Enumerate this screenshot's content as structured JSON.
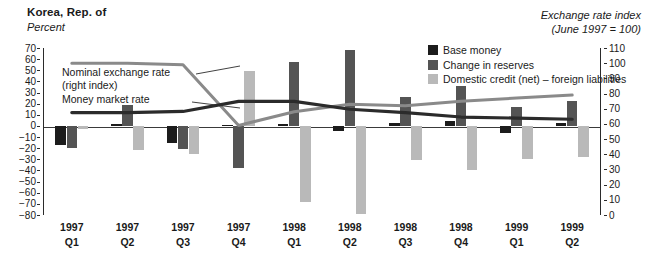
{
  "header": {
    "title": "Korea, Rep. of",
    "left_axis_unit": "Percent",
    "right_axis_unit_line1": "Exchange rate index",
    "right_axis_unit_line2": "(June 1997 = 100)"
  },
  "legend": {
    "items": [
      {
        "label": "Base money",
        "color": "#1c1c1c"
      },
      {
        "label": "Change in reserves",
        "color": "#545454"
      },
      {
        "label": "Domestic credit (net) – foreign liabilities",
        "color": "#b9b9b9"
      }
    ]
  },
  "annotations": [
    {
      "name": "nominal-exchange-rate",
      "line1": "Nominal exchange rate",
      "line2": "(right index)"
    },
    {
      "name": "money-market-rate",
      "line1": "Money market rate",
      "line2": ""
    }
  ],
  "chart_data": {
    "type": "bar",
    "title": "Korea, Rep. of",
    "subtitle": "",
    "xlabel": "",
    "ylabel": "Percent",
    "y2label": "Exchange rate index (June 1997 = 100)",
    "ylim": [
      -80,
      70
    ],
    "y2lim": [
      0,
      110
    ],
    "grid": false,
    "legend_position": "top-right",
    "categories": [
      "1997 Q1",
      "1997 Q2",
      "1997 Q3",
      "1997 Q4",
      "1998 Q1",
      "1998 Q2",
      "1998 Q3",
      "1998 Q4",
      "1999 Q1",
      "1999 Q2"
    ],
    "category_years": [
      "1997",
      "1997",
      "1997",
      "1997",
      "1998",
      "1998",
      "1998",
      "1998",
      "1999",
      "1999"
    ],
    "category_quarters": [
      "Q1",
      "Q2",
      "Q3",
      "Q4",
      "Q1",
      "Q2",
      "Q3",
      "Q4",
      "Q1",
      "Q2"
    ],
    "yticks": [
      70,
      60,
      50,
      40,
      30,
      20,
      10,
      0,
      -10,
      -20,
      -30,
      -40,
      -50,
      -60,
      -70,
      -80
    ],
    "y2ticks": [
      110,
      100,
      90,
      80,
      70,
      60,
      50,
      40,
      30,
      20,
      10,
      0
    ],
    "series": [
      {
        "name": "Base money",
        "axis": "left",
        "kind": "bar",
        "color": "#1c1c1c",
        "values": [
          -17,
          2,
          -15,
          1,
          2,
          -5,
          3,
          4,
          -6,
          3
        ]
      },
      {
        "name": "Change in reserves",
        "axis": "left",
        "kind": "bar",
        "color": "#545454",
        "values": [
          -20,
          19,
          -21,
          -38,
          57,
          68,
          26,
          36,
          17,
          22
        ]
      },
      {
        "name": "Domestic credit (net) – foreign liabilities",
        "axis": "left",
        "kind": "bar",
        "color": "#b9b9b9",
        "values": [
          -3,
          -22,
          -25,
          49,
          -68,
          -79,
          -31,
          -40,
          -30,
          -28
        ]
      },
      {
        "name": "Nominal exchange rate (right index)",
        "axis": "right",
        "kind": "line",
        "color": "#8a8a8a",
        "values": [
          100,
          100,
          99,
          59,
          68,
          73,
          72,
          75,
          77,
          79
        ]
      },
      {
        "name": "Money market rate",
        "axis": "left",
        "kind": "line",
        "color": "#2b2b2b",
        "values": [
          12,
          12,
          13,
          22,
          22,
          15,
          12,
          8,
          7,
          6
        ]
      }
    ]
  }
}
